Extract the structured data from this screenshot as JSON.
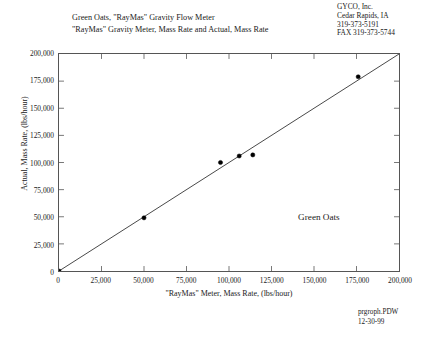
{
  "title": {
    "line1": "Green Oats, \"RayMas\" Gravity Flow Meter",
    "line2": "\"RayMas\" Gravity Meter, Mass Rate and Actual, Mass Rate"
  },
  "company": {
    "name": "GYCO, Inc.",
    "city": "Cedar Rapids, IA",
    "phone": "319-373-5191",
    "fax": "FAX 319-373-5744"
  },
  "footer": {
    "filename": "prgroph.PDW",
    "date": "12-30-99"
  },
  "chart_data": {
    "type": "scatter",
    "xlabel": "\"RayMas\" Meter, Mass Rate, (lbs/hour)",
    "ylabel": "Actual, Mass Rate, (lbs/hour)",
    "xlim": [
      0,
      200000
    ],
    "ylim": [
      0,
      200000
    ],
    "xticks": [
      0,
      25000,
      50000,
      75000,
      100000,
      125000,
      150000,
      175000,
      200000
    ],
    "yticks": [
      0,
      25000,
      50000,
      75000,
      100000,
      125000,
      150000,
      175000,
      200000
    ],
    "xtick_labels": [
      "0",
      "25,000",
      "50,000",
      "75,000",
      "100,000",
      "125,000",
      "150,000",
      "175,000",
      "200,000"
    ],
    "ytick_labels": [
      "0",
      "25,000",
      "50,000",
      "75,000",
      "100,000",
      "125,000",
      "150,000",
      "175,000",
      "200,000"
    ],
    "grid": false,
    "legend": "none",
    "annotations": [
      {
        "text": "Green Oats",
        "x": 152000,
        "y": 50000
      }
    ],
    "series": [
      {
        "name": "Green Oats",
        "marker": "circle",
        "color": "#000000",
        "points": [
          {
            "x": 0,
            "y": 0
          },
          {
            "x": 50000,
            "y": 49000
          },
          {
            "x": 95000,
            "y": 100000
          },
          {
            "x": 106000,
            "y": 106000
          },
          {
            "x": 114000,
            "y": 107000
          },
          {
            "x": 176000,
            "y": 179000
          }
        ]
      }
    ],
    "reference_line": {
      "name": "1:1 line",
      "from": {
        "x": 0,
        "y": 0
      },
      "to": {
        "x": 200000,
        "y": 200000
      },
      "color": "#333333"
    }
  }
}
